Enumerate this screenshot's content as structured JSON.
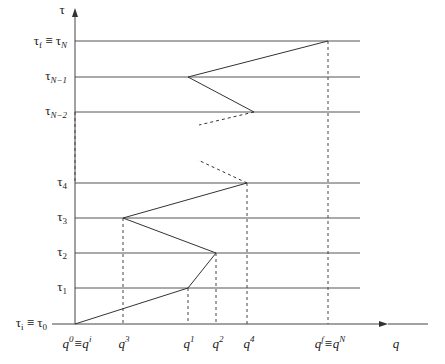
{
  "diagram": {
    "y_axis_label": "τ",
    "x_axis_label": "q",
    "tau_levels": [
      {
        "id": "tau-f",
        "main": "τ",
        "sub": "f",
        "eq": " ≡ τ",
        "eqsub": "N"
      },
      {
        "id": "tau-N-1",
        "main": "τ",
        "sub": "N−1"
      },
      {
        "id": "tau-N-2",
        "main": "τ",
        "sub": "N−2"
      },
      {
        "id": "tau-4",
        "main": "τ",
        "sub": "4"
      },
      {
        "id": "tau-3",
        "main": "τ",
        "sub": "3"
      },
      {
        "id": "tau-2",
        "main": "τ",
        "sub": "2"
      },
      {
        "id": "tau-1",
        "main": "τ",
        "sub": "1"
      },
      {
        "id": "tau-i",
        "main": "τ",
        "sub": "i",
        "eq": " ≡ τ",
        "eqsub": "0"
      }
    ],
    "q_labels": [
      {
        "id": "q0",
        "main": "q",
        "sup": "0",
        "eq": "≡q",
        "eqsup": "i"
      },
      {
        "id": "q3",
        "main": "q",
        "sup": "3"
      },
      {
        "id": "q1",
        "main": "q",
        "sup": "1"
      },
      {
        "id": "q2",
        "main": "q",
        "sup": "2"
      },
      {
        "id": "q4",
        "main": "q",
        "sup": "4"
      },
      {
        "id": "qN",
        "main": "q",
        "sup": "f",
        "eq": "≡q",
        "eqsup": "N"
      }
    ],
    "path_points": [
      {
        "q": "q0",
        "tau": "tau0"
      },
      {
        "q": "q1",
        "tau": "tau1"
      },
      {
        "q": "q2",
        "tau": "tau2"
      },
      {
        "q": "q3",
        "tau": "tau3"
      },
      {
        "q": "q4",
        "tau": "tau4"
      },
      {
        "q": "q4-N-2 gap",
        "tau": "..."
      },
      {
        "q": "qN-2",
        "tau": "tauN-2"
      },
      {
        "q": "q1",
        "tau": "tauN-1"
      },
      {
        "q": "qN",
        "tau": "tauN"
      }
    ]
  }
}
